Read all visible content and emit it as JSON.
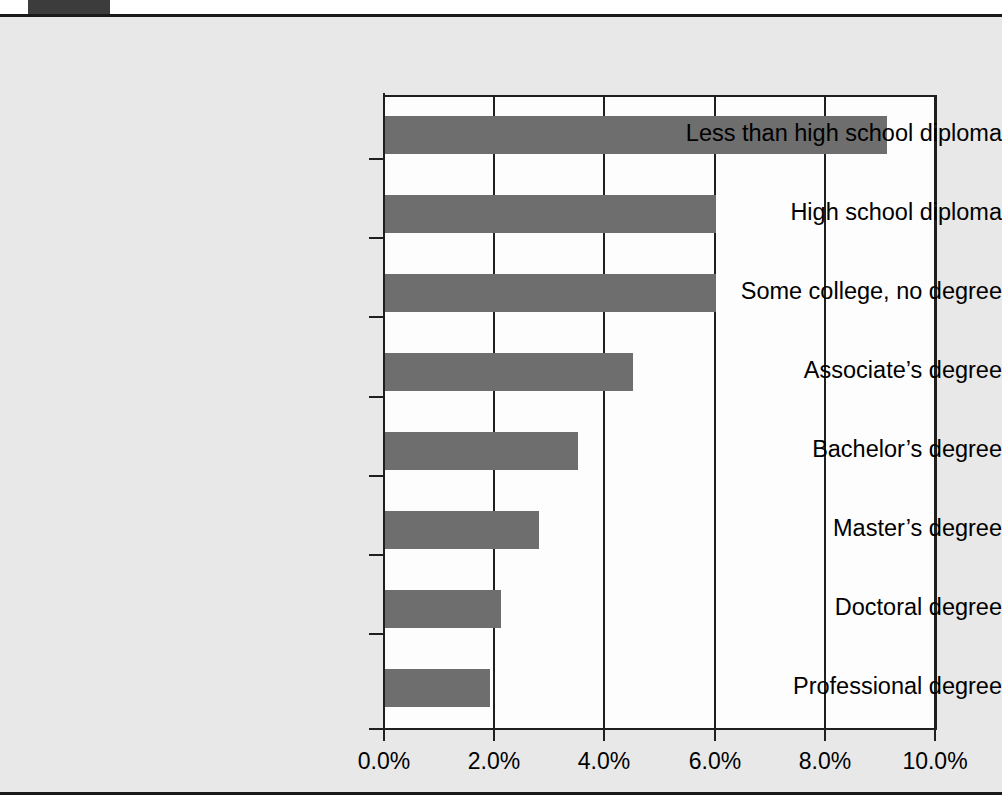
{
  "page": {
    "background_color": "#e8e8e8",
    "plot_background_color": "#fdfdfd",
    "rule_color": "#1a1a1a",
    "tab_color": "#3c3c3c"
  },
  "chart_data": {
    "type": "bar",
    "orientation": "horizontal",
    "title": "",
    "xlabel": "",
    "ylabel": "",
    "xlim": [
      0,
      10
    ],
    "xunit": "%",
    "grid": "vertical",
    "legend": "none",
    "bar_color": "#6e6e6e",
    "categories": [
      "Less than high school diploma",
      "High school diploma",
      "Some college, no degree",
      "Associate’s degree",
      "Bachelor’s degree",
      "Master’s degree",
      "Doctoral degree",
      "Professional degree"
    ],
    "values": [
      9.1,
      6.0,
      6.0,
      4.5,
      3.5,
      2.8,
      2.1,
      1.9
    ],
    "xticks": [
      0,
      2,
      4,
      6,
      8,
      10
    ],
    "xticklabels": [
      "0.0%",
      "2.0%",
      "4.0%",
      "6.0%",
      "8.0%",
      "10.0%"
    ]
  }
}
